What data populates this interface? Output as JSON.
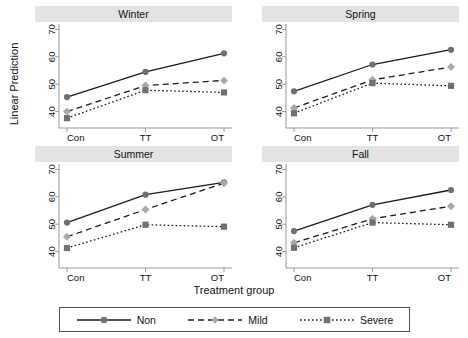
{
  "chart_data": {
    "type": "line",
    "title": "",
    "xlabel": "Treatment group",
    "ylabel": "Linear Prediction",
    "categories": [
      "Con",
      "TT",
      "OT"
    ],
    "ylim": [
      34,
      72
    ],
    "yticks": [
      40,
      50,
      60,
      70
    ],
    "grid": false,
    "legend_position": "bottom",
    "panel_titles": [
      "Winter",
      "Spring",
      "Summer",
      "Fall"
    ],
    "legend": [
      {
        "name": "Non",
        "style": "solid",
        "marker": "circle",
        "color": "#6f6f6f",
        "line_color": "#1a1a1a"
      },
      {
        "name": "Mild",
        "style": "dashed",
        "marker": "diamond",
        "color": "#a8a8a8",
        "line_color": "#1a1a1a"
      },
      {
        "name": "Severe",
        "style": "dotted",
        "marker": "square",
        "color": "#707070",
        "line_color": "#1a1a1a"
      }
    ],
    "panels": [
      {
        "title": "Winter",
        "series": [
          {
            "name": "Non",
            "values": [
              45.3,
              54.5,
              61.3
            ]
          },
          {
            "name": "Mild",
            "values": [
              40.0,
              49.5,
              51.4
            ]
          },
          {
            "name": "Severe",
            "values": [
              37.6,
              47.8,
              47.0
            ]
          }
        ]
      },
      {
        "title": "Spring",
        "series": [
          {
            "name": "Non",
            "values": [
              47.4,
              57.2,
              62.6
            ]
          },
          {
            "name": "Mild",
            "values": [
              41.3,
              51.6,
              56.3
            ]
          },
          {
            "name": "Severe",
            "values": [
              39.4,
              50.4,
              49.4
            ]
          }
        ]
      },
      {
        "title": "Summer",
        "series": [
          {
            "name": "Non",
            "values": [
              50.6,
              60.8,
              65.3
            ]
          },
          {
            "name": "Mild",
            "values": [
              45.4,
              55.4,
              65.0
            ]
          },
          {
            "name": "Severe",
            "values": [
              41.3,
              49.8,
              49.1
            ]
          }
        ]
      },
      {
        "title": "Fall",
        "series": [
          {
            "name": "Non",
            "values": [
              47.5,
              57.1,
              62.5
            ]
          },
          {
            "name": "Mild",
            "values": [
              43.2,
              52.0,
              56.6
            ]
          },
          {
            "name": "Severe",
            "values": [
              41.4,
              50.6,
              49.8
            ]
          }
        ]
      }
    ]
  },
  "axis": {
    "ylabel": "Linear Prediction",
    "xlabel": "Treatment group",
    "yticks": [
      "40",
      "50",
      "60",
      "70"
    ],
    "xticks": [
      "Con",
      "TT",
      "OT"
    ]
  },
  "panels": {
    "winter": "Winter",
    "spring": "Spring",
    "summer": "Summer",
    "fall": "Fall"
  },
  "legend": {
    "non": "Non",
    "mild": "Mild",
    "severe": "Severe"
  }
}
